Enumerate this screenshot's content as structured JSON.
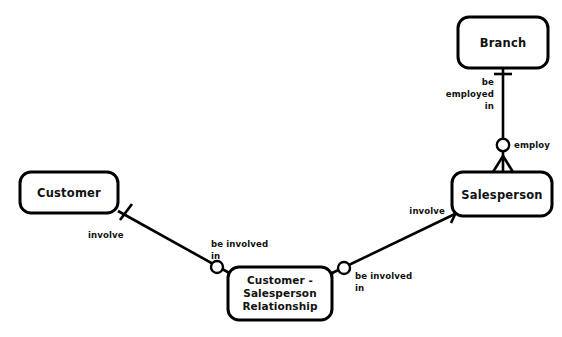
{
  "diagram": {
    "notation": "crow-foot",
    "background_color": "#ffffff",
    "line_color": "#000000",
    "entities": [
      {
        "id": "customer",
        "label": "Customer",
        "x": 20,
        "y": 172,
        "width": 98,
        "height": 41
      },
      {
        "id": "branch",
        "label": "Branch",
        "x": 458,
        "y": 17,
        "width": 90,
        "height": 51
      },
      {
        "id": "salesperson",
        "label": "Salesperson",
        "x": 452,
        "y": 172,
        "width": 100,
        "height": 44
      }
    ],
    "relationship_box": {
      "id": "customer-salesperson-relationship",
      "line1": "Customer -",
      "line2": "Salesperson",
      "line3": "Relationship",
      "x": 228,
      "y": 267,
      "width": 104,
      "height": 53
    },
    "edge_labels": {
      "customer_involve": "involve",
      "rel_left_line1": "be  involved",
      "rel_left_line2": "in",
      "rel_right_line1": "be  involved",
      "rel_right_line2": "in",
      "salesperson_involve": "involve",
      "branch_be_employed_line1": "be",
      "branch_be_employed_line2": "employed",
      "branch_be_employed_line3": "in",
      "salesperson_employ": "employ"
    },
    "connections": [
      {
        "id": "customer-to-relationship",
        "from": "customer",
        "to": "customer-salesperson-relationship",
        "from_cardinality": "one",
        "to_cardinality": "zero-or-many"
      },
      {
        "id": "relationship-to-salesperson",
        "from": "customer-salesperson-relationship",
        "to": "salesperson",
        "from_cardinality": "zero-or-many",
        "to_cardinality": "one"
      },
      {
        "id": "branch-to-salesperson",
        "from": "branch",
        "to": "salesperson",
        "from_cardinality": "one",
        "to_cardinality": "zero-or-many"
      }
    ]
  }
}
